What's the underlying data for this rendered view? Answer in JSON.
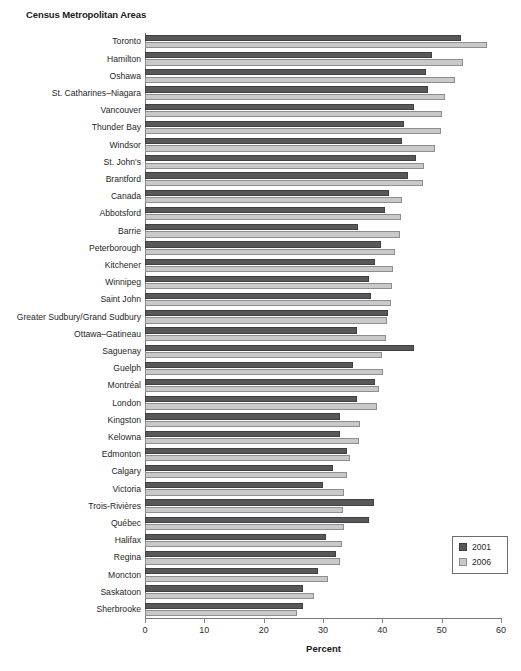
{
  "chart_title": "Census Metropolitan Areas",
  "legend": {
    "position": "bottom-right",
    "entries": [
      {
        "label": "2001",
        "color": "#58585a"
      },
      {
        "label": "2006",
        "color": "#c9c9c9"
      }
    ]
  },
  "axis": {
    "x_title": "Percent",
    "x_ticks": [
      "0",
      "10",
      "20",
      "30",
      "40",
      "50",
      "60"
    ]
  },
  "chart_data": {
    "type": "bar",
    "orientation": "horizontal",
    "title": "Census Metropolitan Areas",
    "xlabel": "Percent",
    "ylabel": "",
    "xlim": [
      0,
      60
    ],
    "xticks": [
      0,
      10,
      20,
      30,
      40,
      50,
      60
    ],
    "grid": false,
    "legend_position": "bottom-right",
    "categories": [
      "Toronto",
      "Hamilton",
      "Oshawa",
      "St. Catharines–Niagara",
      "Vancouver",
      "Thunder Bay",
      "Windsor",
      "St. John's",
      "Brantford",
      "Canada",
      "Abbotsford",
      "Barrie",
      "Peterborough",
      "Kitchener",
      "Winnipeg",
      "Saint John",
      "Greater Sudbury/Grand Sudbury",
      "Ottawa–Gatineau",
      "Saguenay",
      "Guelph",
      "Montréal",
      "London",
      "Kingston",
      "Kelowna",
      "Edmonton",
      "Calgary",
      "Victoria",
      "Trois-Rivières",
      "Québec",
      "Halifax",
      "Regina",
      "Moncton",
      "Saskatoon",
      "Sherbrooke"
    ],
    "series": [
      {
        "name": "2001",
        "color": "#58585a",
        "values": [
          53.3,
          48.4,
          47.4,
          47.7,
          45.4,
          43.6,
          43.3,
          45.7,
          44.4,
          41.2,
          40.5,
          35.9,
          39.8,
          38.8,
          37.8,
          38.1,
          41.0,
          35.7,
          45.4,
          35.0,
          38.8,
          35.8,
          32.8,
          32.8,
          34.0,
          31.7,
          30.0,
          38.6,
          37.8,
          30.5,
          32.2,
          29.2,
          26.7,
          26.7
        ]
      },
      {
        "name": "2006",
        "color": "#c9c9c9",
        "values": [
          57.7,
          53.6,
          52.3,
          50.6,
          50.1,
          49.9,
          48.9,
          47.1,
          46.9,
          43.3,
          43.2,
          43.0,
          42.2,
          41.8,
          41.6,
          41.4,
          40.8,
          40.6,
          39.9,
          40.1,
          39.5,
          39.1,
          36.2,
          36.1,
          34.5,
          34.0,
          33.5,
          33.3,
          33.6,
          33.2,
          32.9,
          30.8,
          28.4,
          25.6
        ]
      }
    ]
  }
}
